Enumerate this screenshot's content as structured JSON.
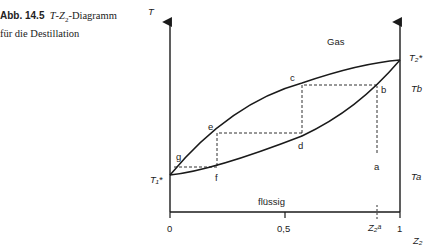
{
  "caption": {
    "number": "Abb. 14.5",
    "title_rest": "T-Z₂-Diagramm",
    "line2": "für die Destillation"
  },
  "diagram": {
    "y_axis_label": "T",
    "x_axis_label": "Z₂",
    "x_ticks": [
      "0",
      "0,5",
      "1"
    ],
    "x_marker": "Z₂ᵃ",
    "left_axis_label": "T₁*",
    "right_axis_labels": {
      "t2_star": "T₂*",
      "tb": "Tb",
      "ta": "Ta"
    },
    "regions": {
      "gas": "Gas",
      "liquid": "flüssig"
    },
    "points": [
      "a",
      "b",
      "c",
      "d",
      "e",
      "f",
      "g"
    ],
    "colors": {
      "line": "#1a1a1a",
      "text": "#222222",
      "background": "#ffffff"
    }
  }
}
